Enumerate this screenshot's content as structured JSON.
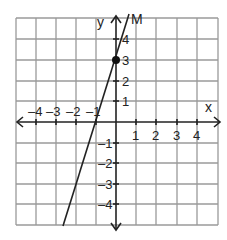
{
  "figure": {
    "type": "coordinate-plane",
    "x_axis_label": "x",
    "y_axis_label": "y",
    "line_label": "M",
    "x_range": [
      -5,
      5
    ],
    "y_range": [
      -5,
      5
    ],
    "x_tick_labels": [
      "-4",
      "-3",
      "-2",
      "-1",
      "1",
      "2",
      "3",
      "4"
    ],
    "y_tick_labels": [
      "4",
      "3",
      "2",
      "1",
      "-1",
      "-2",
      "-3",
      "-4"
    ],
    "point": {
      "x": 0,
      "y": 3
    },
    "line": {
      "slope": 3,
      "intercept": 3,
      "passes_through": [
        [
          -1,
          0
        ],
        [
          0,
          3
        ]
      ]
    },
    "colors": {
      "grid": "#9a9a9a",
      "axis": "#222222",
      "line": "#222222",
      "point": "#111111"
    }
  }
}
